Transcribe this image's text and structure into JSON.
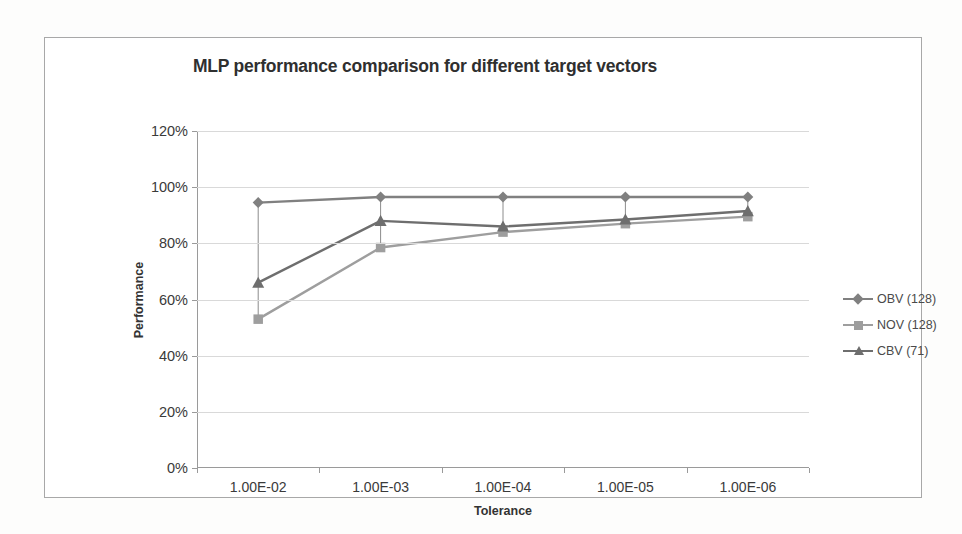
{
  "chart_data": {
    "type": "line",
    "title": "MLP performance comparison for different target vectors",
    "xlabel": "Tolerance",
    "ylabel": "Performance",
    "categories": [
      "1.00E-02",
      "1.00E-03",
      "1.00E-04",
      "1.00E-05",
      "1.00E-06"
    ],
    "ylim": [
      0,
      120
    ],
    "ytick_labels": [
      "0%",
      "20%",
      "40%",
      "60%",
      "80%",
      "100%",
      "120%"
    ],
    "ytick_values": [
      0,
      20,
      40,
      60,
      80,
      100,
      120
    ],
    "grid": true,
    "legend_position": "right",
    "series": [
      {
        "name": "OBV (128)",
        "marker": "diamond",
        "color": "#808080",
        "values": [
          94.5,
          96.5,
          96.5,
          96.5,
          96.5
        ]
      },
      {
        "name": "NOV (128)",
        "marker": "square",
        "color": "#9e9e9e",
        "values": [
          53.0,
          78.5,
          84.0,
          87.0,
          89.5
        ]
      },
      {
        "name": "CBV (71)",
        "marker": "triangle",
        "color": "#6e6e6e",
        "values": [
          66.0,
          88.0,
          86.0,
          88.5,
          91.5
        ]
      }
    ]
  }
}
